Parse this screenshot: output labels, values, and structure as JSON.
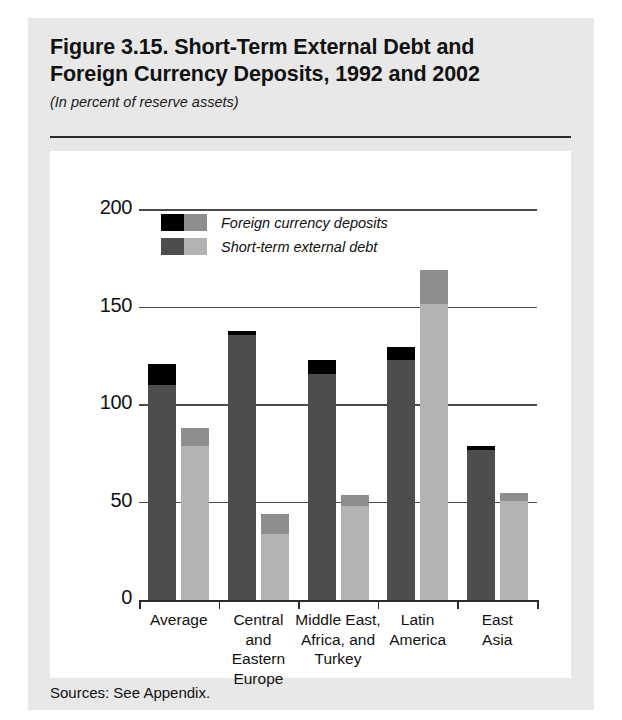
{
  "figure": {
    "title": "Figure 3.15. Short-Term External Debt and\nForeign Currency Deposits, 1992 and 2002",
    "subtitle": "(In percent of reserve assets)",
    "source": "Sources: See Appendix."
  },
  "colors": {
    "panel_background": "#e8e8e8",
    "plot_background": "#ffffff",
    "gridline": "#4a4a4a",
    "axis": "#2b2b2b",
    "deposits_1992": "#000000",
    "debt_1992": "#4d4d4d",
    "deposits_2002": "#8e8e8e",
    "debt_2002": "#b3b3b3",
    "text": "#111111"
  },
  "legend": {
    "position": "inside-top-left",
    "entries": [
      {
        "label": "Foreign currency deposits",
        "swatch_left": "#000000",
        "swatch_right": "#8e8e8e",
        "series_key": "deposits"
      },
      {
        "label": "Short-term external debt",
        "swatch_left": "#4d4d4d",
        "swatch_right": "#b3b3b3",
        "series_key": "debt"
      }
    ]
  },
  "chart_data": {
    "type": "bar",
    "subtype": "grouped-stacked",
    "title": "Figure 3.15. Short-Term External Debt and Foreign Currency Deposits, 1992 and 2002",
    "subtitle": "(In percent of reserve assets)",
    "xlabel": "",
    "ylabel": "",
    "ylim": [
      0,
      200
    ],
    "yticks": [
      0,
      50,
      100,
      150,
      200
    ],
    "ytick_labels": [
      "0",
      "50",
      "100",
      "150",
      "200"
    ],
    "grid": true,
    "grid_axis": "y",
    "categories": [
      "Average",
      "Central\nand\nEastern\nEurope",
      "Middle East,\nAfrica, and\nTurkey",
      "Latin\nAmerica",
      "East\nAsia"
    ],
    "groups": [
      "1992",
      "2002"
    ],
    "series": [
      {
        "name": "Short-term external debt",
        "group": "1992",
        "color": "#4d4d4d",
        "values": [
          110,
          136,
          116,
          123,
          77
        ]
      },
      {
        "name": "Foreign currency deposits",
        "group": "1992",
        "color": "#000000",
        "values": [
          11,
          2,
          7,
          7,
          2
        ]
      },
      {
        "name": "Short-term external debt",
        "group": "2002",
        "color": "#b3b3b3",
        "values": [
          79,
          34,
          48,
          152,
          51
        ]
      },
      {
        "name": "Foreign currency deposits",
        "group": "2002",
        "color": "#8e8e8e",
        "values": [
          9,
          10,
          6,
          17,
          4
        ]
      }
    ],
    "totals": {
      "1992": [
        121,
        138,
        123,
        130,
        79
      ],
      "2002": [
        88,
        44,
        54,
        169,
        55
      ]
    }
  }
}
